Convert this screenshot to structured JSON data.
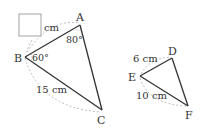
{
  "triangle_abc": {
    "vertices": {
      "A": "A",
      "B": "B",
      "C": "C"
    },
    "side_ab_label": "cm",
    "side_ab_blank": "answer-box",
    "side_bc_label": "15 cm",
    "angle_a_label": "80°",
    "angle_b_label": "60°"
  },
  "triangle_def": {
    "vertices": {
      "D": "D",
      "E": "E",
      "F": "F"
    },
    "side_ed_label": "6 cm",
    "side_ef_label": "10 cm"
  },
  "colors": {
    "line": "#333333",
    "dashed_arc": "#aaaaaa",
    "box_border": "#999999"
  }
}
